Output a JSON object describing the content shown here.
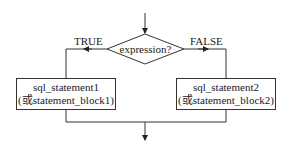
{
  "diagram": {
    "type": "flowchart",
    "title": "",
    "condition": {
      "label": "expression?"
    },
    "branches": {
      "true": {
        "label": "TRUE",
        "box": {
          "line1": "sql_statement1",
          "line2": "(或statement_block1)"
        }
      },
      "false": {
        "label": "FALSE",
        "box": {
          "line1": "sql_statement2",
          "line2": "(或statement_block2)"
        }
      }
    },
    "colors": {
      "stroke": "#333333",
      "text": "#1a1a1a",
      "background": "#ffffff"
    }
  }
}
